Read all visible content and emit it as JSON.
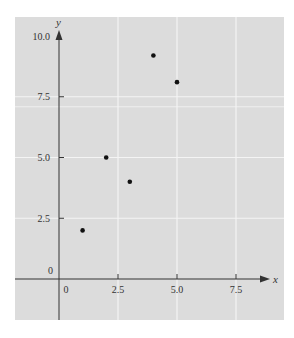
{
  "chart_data": {
    "type": "scatter",
    "title": "",
    "xlabel": "x",
    "ylabel": "y",
    "xlim": [
      -1.5,
      9.5
    ],
    "ylim": [
      -1.6,
      10.8
    ],
    "x_ticks": [
      0,
      2.5,
      5.0,
      7.5
    ],
    "x_tick_labels": [
      "0",
      "2.5",
      "5.0",
      "7.5"
    ],
    "y_ticks": [
      0,
      2.5,
      5.0,
      7.5,
      10.0
    ],
    "y_tick_labels": [
      "0",
      "2.5",
      "5.0",
      "7.5",
      "10.0"
    ],
    "grid": true,
    "legend": null,
    "series": [
      {
        "name": "points",
        "x": [
          1,
          2,
          3,
          4,
          5
        ],
        "y": [
          2.0,
          5.0,
          4.0,
          9.2,
          8.1
        ]
      }
    ]
  },
  "colors": {
    "panel_bg": "#dcdcdc",
    "grid": "#f4f4f4",
    "axis": "#333333",
    "point": "#111111"
  }
}
